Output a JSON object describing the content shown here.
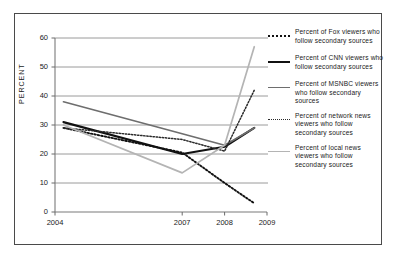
{
  "chart_data": {
    "type": "line",
    "title": "",
    "xlabel": "",
    "ylabel": "PERCENT",
    "xlim": [
      2004,
      2009
    ],
    "ylim": [
      0,
      60
    ],
    "grid": true,
    "legend_position": "right",
    "x_ticks": [
      "2004",
      "2007",
      "2008",
      "2009"
    ],
    "x_tick_values": [
      2004,
      2007,
      2008,
      2009
    ],
    "y_ticks": [
      "0",
      "10",
      "20",
      "30",
      "40",
      "50",
      "60"
    ],
    "y_tick_values": [
      0,
      10,
      20,
      30,
      40,
      50,
      60
    ],
    "x": [
      2004.2,
      2007,
      2008,
      2008.7
    ],
    "series": [
      {
        "name": "Percent of Fox viewers who follow secondary sources",
        "short": "fox",
        "style": "dotted-black",
        "color": "#111111",
        "values": [
          29.0,
          20.5,
          10.0,
          3.0
        ]
      },
      {
        "name": "Percent of CNN viewers who follow secondary sources",
        "short": "cnn",
        "style": "solid-black",
        "color": "#111111",
        "values": [
          31.0,
          20.0,
          22.5,
          29.0
        ]
      },
      {
        "name": "Percent of MSNBC viewers who follow secondary sources",
        "short": "msnbc",
        "style": "solid-gray",
        "color": "#6e6e6e",
        "values": [
          38.0,
          27.0,
          23.0,
          29.0
        ]
      },
      {
        "name": "Percent of network news viewers who follow secondary sources",
        "short": "network-news",
        "style": "dotted-fine",
        "color": "#2a2a2a",
        "values": [
          29.0,
          25.0,
          21.0,
          42.0
        ]
      },
      {
        "name": "Percent of local news viewers who follow secondary sources",
        "short": "local-news",
        "style": "solid-lightgray",
        "color": "#b4b4b4",
        "values": [
          30.0,
          13.5,
          23.0,
          57.0
        ]
      }
    ]
  },
  "legend": {
    "entries": [
      {
        "label": "Percent of Fox viewers who follow secondary sources",
        "marker": "dotted-black"
      },
      {
        "label": "Percent of CNN viewers who follow secondary sources",
        "marker": "solid-black"
      },
      {
        "label": "Percent of MSNBC viewers who follow secondary sources",
        "marker": "solid-gray"
      },
      {
        "label": "Percent of network news viewers who follow secondary sources",
        "marker": "dotted-fine"
      },
      {
        "label": "Percent of local news viewers who follow secondary sources",
        "marker": "solid-lightgray"
      }
    ]
  }
}
